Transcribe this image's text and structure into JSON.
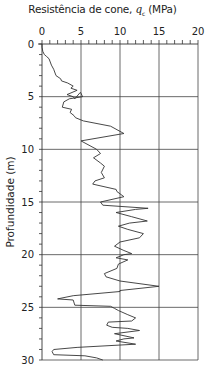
{
  "chart_data": {
    "type": "line",
    "title": "Resistência de cone, qc (MPa)",
    "title_parts": {
      "prefix": "Resistência de cone, ",
      "symbol": "q",
      "subscript": "c",
      "suffix": " (MPa)"
    },
    "xlabel": "Resistência de cone, qc (MPa)",
    "ylabel": "Profundidade (m)",
    "xlim": [
      0,
      20
    ],
    "ylim": [
      30,
      0
    ],
    "x_ticks": [
      0,
      5,
      10,
      15,
      20
    ],
    "y_ticks": [
      0,
      5,
      10,
      15,
      20,
      25,
      30
    ],
    "x_minor_step": 1,
    "y_minor_step": 1,
    "x_axis_position": "top",
    "grid": true,
    "legend": null,
    "series": [
      {
        "name": "qc profile",
        "color": "#333333",
        "points": [
          [
            0.0,
            0.0
          ],
          [
            0.3,
            0.0
          ],
          [
            0.7,
            0.1
          ],
          [
            1.0,
            0.3
          ],
          [
            1.2,
            0.6
          ],
          [
            1.4,
            0.9
          ],
          [
            2.0,
            1.2
          ],
          [
            2.4,
            1.5
          ],
          [
            3.0,
            1.8
          ],
          [
            3.3,
            2.4
          ],
          [
            3.5,
            2.5
          ],
          [
            3.7,
            3.3
          ],
          [
            4.0,
            4.0
          ],
          [
            4.2,
            3.7
          ],
          [
            4.4,
            4.5
          ],
          [
            4.8,
            3.2
          ],
          [
            5.0,
            4.0
          ],
          [
            5.2,
            4.2
          ],
          [
            4.6,
            4.9
          ],
          [
            4.6,
            4.95
          ],
          [
            5.0,
            5.2
          ],
          [
            5.2,
            3.5
          ],
          [
            5.5,
            2.8
          ],
          [
            6.0,
            2.6
          ],
          [
            6.2,
            3.8
          ],
          [
            6.5,
            3.6
          ],
          [
            6.8,
            4.1
          ],
          [
            7.0,
            4.3
          ],
          [
            7.3,
            5.3
          ],
          [
            7.8,
            8.8
          ],
          [
            8.5,
            10.5
          ],
          [
            9.2,
            5.0
          ],
          [
            10.0,
            7.0
          ],
          [
            10.4,
            7.5
          ],
          [
            10.8,
            6.6
          ],
          [
            11.3,
            7.5
          ],
          [
            11.6,
            8.0
          ],
          [
            12.2,
            7.6
          ],
          [
            12.7,
            8.0
          ],
          [
            13.0,
            6.8
          ],
          [
            13.3,
            6.5
          ],
          [
            13.8,
            9.5
          ],
          [
            14.0,
            9.6
          ],
          [
            14.5,
            10.5
          ],
          [
            15.0,
            7.5
          ],
          [
            15.3,
            7.8
          ],
          [
            15.6,
            13.6
          ],
          [
            15.7,
            12.0
          ],
          [
            16.0,
            9.5
          ],
          [
            16.4,
            11.5
          ],
          [
            16.8,
            13.5
          ],
          [
            17.0,
            11.2
          ],
          [
            17.3,
            9.8
          ],
          [
            17.6,
            11.0
          ],
          [
            18.0,
            13.0
          ],
          [
            18.4,
            12.5
          ],
          [
            18.8,
            10.0
          ],
          [
            19.2,
            9.3
          ],
          [
            19.6,
            10.5
          ],
          [
            19.9,
            11.5
          ],
          [
            20.0,
            10.5
          ],
          [
            20.3,
            9.5
          ],
          [
            20.5,
            11.0
          ],
          [
            20.9,
            9.8
          ],
          [
            21.3,
            9.6
          ],
          [
            21.8,
            8.0
          ],
          [
            22.1,
            8.2
          ],
          [
            22.5,
            10.0
          ],
          [
            23.0,
            15.0
          ],
          [
            23.4,
            10.0
          ],
          [
            23.5,
            10.0
          ],
          [
            23.9,
            4.0
          ],
          [
            24.2,
            2.0
          ],
          [
            24.3,
            4.0
          ],
          [
            24.8,
            4.2
          ],
          [
            24.9,
            8.8
          ],
          [
            25.1,
            9.3
          ],
          [
            25.3,
            9.8
          ],
          [
            25.7,
            11.0
          ],
          [
            26.0,
            12.0
          ],
          [
            26.3,
            11.5
          ],
          [
            26.4,
            8.5
          ],
          [
            26.7,
            8.3
          ],
          [
            26.9,
            9.0
          ],
          [
            27.0,
            11.0
          ],
          [
            27.2,
            12.5
          ],
          [
            27.5,
            9.3
          ],
          [
            27.9,
            11.8
          ],
          [
            28.0,
            10.5
          ],
          [
            28.2,
            9.5
          ],
          [
            28.5,
            12.0
          ],
          [
            28.8,
            4.5
          ],
          [
            29.0,
            1.5
          ],
          [
            29.2,
            1.3
          ],
          [
            29.5,
            1.5
          ],
          [
            29.6,
            5.5
          ],
          [
            29.8,
            7.0
          ],
          [
            30.0,
            7.8
          ]
        ]
      }
    ]
  },
  "axes": {
    "x_tick_labels": [
      "0",
      "5",
      "10",
      "15",
      "20"
    ],
    "y_tick_labels": [
      "0",
      "5",
      "10",
      "15",
      "20",
      "25",
      "30"
    ]
  }
}
